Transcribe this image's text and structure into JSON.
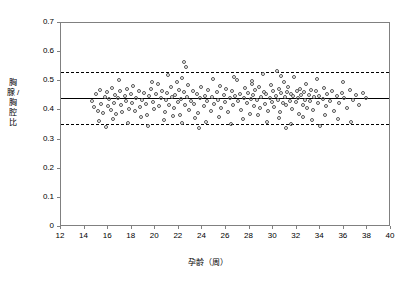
{
  "chart_data": {
    "type": "scatter",
    "title": "",
    "xlabel": "孕龄（周）",
    "ylabel": "胸腺 / 胸腔比",
    "xlim": [
      12,
      40
    ],
    "ylim": [
      0,
      0.7
    ],
    "xticks": [
      "12",
      "14",
      "16",
      "18",
      "20",
      "22",
      "24",
      "26",
      "28",
      "30",
      "32",
      "34",
      "36",
      "38",
      "40"
    ],
    "yticks": [
      "0",
      "0.1",
      "0.2",
      "0.3",
      "0.4",
      "0.5",
      "0.6",
      "0.7"
    ],
    "grid": false,
    "legend": null,
    "annotations": [],
    "reference_lines": [
      {
        "name": "mean",
        "y": 0.443,
        "style": "solid",
        "color": "#000000"
      },
      {
        "name": "upper-limit",
        "y": 0.533,
        "style": "dashed",
        "color": "#000000"
      },
      {
        "name": "lower-limit",
        "y": 0.352,
        "style": "dashed",
        "color": "#000000"
      }
    ],
    "points": [
      [
        14.6,
        0.432
      ],
      [
        14.8,
        0.411
      ],
      [
        15.0,
        0.455
      ],
      [
        15.1,
        0.398
      ],
      [
        15.3,
        0.47
      ],
      [
        15.4,
        0.423
      ],
      [
        15.6,
        0.391
      ],
      [
        15.7,
        0.446
      ],
      [
        15.9,
        0.462
      ],
      [
        16.0,
        0.414
      ],
      [
        16.1,
        0.438
      ],
      [
        16.2,
        0.401
      ],
      [
        16.3,
        0.478
      ],
      [
        16.5,
        0.427
      ],
      [
        16.6,
        0.452
      ],
      [
        16.7,
        0.389
      ],
      [
        16.8,
        0.441
      ],
      [
        17.0,
        0.466
      ],
      [
        17.1,
        0.418
      ],
      [
        17.2,
        0.395
      ],
      [
        17.4,
        0.449
      ],
      [
        17.5,
        0.434
      ],
      [
        17.6,
        0.472
      ],
      [
        17.8,
        0.406
      ],
      [
        17.9,
        0.457
      ],
      [
        18.0,
        0.425
      ],
      [
        18.1,
        0.483
      ],
      [
        18.3,
        0.399
      ],
      [
        18.4,
        0.444
      ],
      [
        18.6,
        0.465
      ],
      [
        18.7,
        0.412
      ],
      [
        18.9,
        0.437
      ],
      [
        19.0,
        0.459
      ],
      [
        19.2,
        0.421
      ],
      [
        19.3,
        0.386
      ],
      [
        19.5,
        0.448
      ],
      [
        19.6,
        0.474
      ],
      [
        19.8,
        0.43
      ],
      [
        19.9,
        0.404
      ],
      [
        20.1,
        0.455
      ],
      [
        20.2,
        0.492
      ],
      [
        20.3,
        0.416
      ],
      [
        20.5,
        0.443
      ],
      [
        20.6,
        0.467
      ],
      [
        20.8,
        0.393
      ],
      [
        20.9,
        0.436
      ],
      [
        21.0,
        0.46
      ],
      [
        21.2,
        0.419
      ],
      [
        21.3,
        0.481
      ],
      [
        21.4,
        0.447
      ],
      [
        21.6,
        0.408
      ],
      [
        21.7,
        0.453
      ],
      [
        21.8,
        0.497
      ],
      [
        21.9,
        0.428
      ],
      [
        22.0,
        0.471
      ],
      [
        22.1,
        0.384
      ],
      [
        22.2,
        0.44
      ],
      [
        22.3,
        0.512
      ],
      [
        22.4,
        0.462
      ],
      [
        22.5,
        0.417
      ],
      [
        22.6,
        0.549
      ],
      [
        22.7,
        0.445
      ],
      [
        22.8,
        0.488
      ],
      [
        22.9,
        0.402
      ],
      [
        23.0,
        0.434
      ],
      [
        23.2,
        0.468
      ],
      [
        23.3,
        0.423
      ],
      [
        23.5,
        0.456
      ],
      [
        23.6,
        0.391
      ],
      [
        23.8,
        0.442
      ],
      [
        23.9,
        0.479
      ],
      [
        24.1,
        0.414
      ],
      [
        24.2,
        0.451
      ],
      [
        24.4,
        0.433
      ],
      [
        24.5,
        0.469
      ],
      [
        24.7,
        0.398
      ],
      [
        24.8,
        0.446
      ],
      [
        25.0,
        0.421
      ],
      [
        25.2,
        0.463
      ],
      [
        25.3,
        0.437
      ],
      [
        25.5,
        0.485
      ],
      [
        25.6,
        0.409
      ],
      [
        25.8,
        0.452
      ],
      [
        25.9,
        0.428
      ],
      [
        26.0,
        0.474
      ],
      [
        26.2,
        0.395
      ],
      [
        26.3,
        0.441
      ],
      [
        26.5,
        0.466
      ],
      [
        26.6,
        0.418
      ],
      [
        26.8,
        0.449
      ],
      [
        26.9,
        0.504
      ],
      [
        27.0,
        0.431
      ],
      [
        27.2,
        0.458
      ],
      [
        27.3,
        0.403
      ],
      [
        27.5,
        0.444
      ],
      [
        27.6,
        0.476
      ],
      [
        27.8,
        0.425
      ],
      [
        27.9,
        0.461
      ],
      [
        28.0,
        0.388
      ],
      [
        28.1,
        0.439
      ],
      [
        28.2,
        0.492
      ],
      [
        28.3,
        0.453
      ],
      [
        28.4,
        0.416
      ],
      [
        28.5,
        0.47
      ],
      [
        28.6,
        0.435
      ],
      [
        28.8,
        0.481
      ],
      [
        28.9,
        0.407
      ],
      [
        29.0,
        0.447
      ],
      [
        29.1,
        0.524
      ],
      [
        29.2,
        0.464
      ],
      [
        29.3,
        0.422
      ],
      [
        29.4,
        0.455
      ],
      [
        29.6,
        0.399
      ],
      [
        29.7,
        0.443
      ],
      [
        29.8,
        0.487
      ],
      [
        29.9,
        0.43
      ],
      [
        30.0,
        0.468
      ],
      [
        30.1,
        0.412
      ],
      [
        30.2,
        0.45
      ],
      [
        30.3,
        0.534
      ],
      [
        30.4,
        0.436
      ],
      [
        30.5,
        0.473
      ],
      [
        30.6,
        0.394
      ],
      [
        30.7,
        0.459
      ],
      [
        30.8,
        0.427
      ],
      [
        30.9,
        0.496
      ],
      [
        31.0,
        0.445
      ],
      [
        31.1,
        0.418
      ],
      [
        31.2,
        0.463
      ],
      [
        31.3,
        0.482
      ],
      [
        31.4,
        0.433
      ],
      [
        31.5,
        0.457
      ],
      [
        31.6,
        0.405
      ],
      [
        31.7,
        0.448
      ],
      [
        31.8,
        0.513
      ],
      [
        31.9,
        0.429
      ],
      [
        32.0,
        0.467
      ],
      [
        32.1,
        0.441
      ],
      [
        32.2,
        0.389
      ],
      [
        32.3,
        0.475
      ],
      [
        32.4,
        0.452
      ],
      [
        32.5,
        0.42
      ],
      [
        32.6,
        0.462
      ],
      [
        32.7,
        0.437
      ],
      [
        32.8,
        0.489
      ],
      [
        32.9,
        0.41
      ],
      [
        33.0,
        0.454
      ],
      [
        33.1,
        0.431
      ],
      [
        33.2,
        0.471
      ],
      [
        33.4,
        0.4
      ],
      [
        33.5,
        0.446
      ],
      [
        33.6,
        0.465
      ],
      [
        33.8,
        0.424
      ],
      [
        33.9,
        0.451
      ],
      [
        34.0,
        0.345
      ],
      [
        34.2,
        0.44
      ],
      [
        34.3,
        0.478
      ],
      [
        34.5,
        0.416
      ],
      [
        34.6,
        0.458
      ],
      [
        34.8,
        0.434
      ],
      [
        35.0,
        0.468
      ],
      [
        35.2,
        0.397
      ],
      [
        35.4,
        0.449
      ],
      [
        35.6,
        0.425
      ],
      [
        35.8,
        0.461
      ],
      [
        36.0,
        0.443
      ],
      [
        36.3,
        0.409
      ],
      [
        36.5,
        0.47
      ],
      [
        36.8,
        0.436
      ],
      [
        37.0,
        0.452
      ],
      [
        37.3,
        0.418
      ],
      [
        37.6,
        0.459
      ],
      [
        37.9,
        0.441
      ],
      [
        15.2,
        0.365
      ],
      [
        16.4,
        0.372
      ],
      [
        17.7,
        0.358
      ],
      [
        18.8,
        0.376
      ],
      [
        19.4,
        0.348
      ],
      [
        20.7,
        0.368
      ],
      [
        21.5,
        0.381
      ],
      [
        22.3,
        0.357
      ],
      [
        23.4,
        0.374
      ],
      [
        24.3,
        0.362
      ],
      [
        25.4,
        0.378
      ],
      [
        26.4,
        0.355
      ],
      [
        27.4,
        0.37
      ],
      [
        28.7,
        0.383
      ],
      [
        29.5,
        0.361
      ],
      [
        30.5,
        0.375
      ],
      [
        31.5,
        0.353
      ],
      [
        32.5,
        0.379
      ],
      [
        33.3,
        0.366
      ],
      [
        34.4,
        0.386
      ],
      [
        35.5,
        0.371
      ],
      [
        36.6,
        0.359
      ],
      [
        16.9,
        0.505
      ],
      [
        19.7,
        0.498
      ],
      [
        21.1,
        0.521
      ],
      [
        24.9,
        0.507
      ],
      [
        26.7,
        0.515
      ],
      [
        28.2,
        0.502
      ],
      [
        30.7,
        0.519
      ],
      [
        33.7,
        0.509
      ],
      [
        35.9,
        0.497
      ],
      [
        22.45,
        0.566
      ],
      [
        15.8,
        0.344
      ],
      [
        23.7,
        0.34
      ],
      [
        31.1,
        0.338
      ]
    ]
  }
}
